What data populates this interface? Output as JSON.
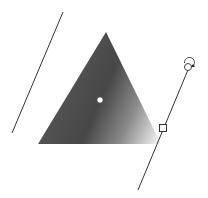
{
  "canvas": {
    "width": 208,
    "height": 198,
    "background": "#ffffff"
  },
  "shape": {
    "type": "triangle",
    "points": "106,32 38,144 161,144",
    "gradient": {
      "type": "linear",
      "stops": [
        {
          "offset": "0%",
          "color": "#5a5a5a"
        },
        {
          "offset": "55%",
          "color": "#4a4a4a"
        },
        {
          "offset": "100%",
          "color": "#f2f2f2"
        }
      ]
    }
  },
  "gradient_tool": {
    "start_line": {
      "x1": 63,
      "y1": 12,
      "x2": 12,
      "y2": 133
    },
    "end_line": {
      "x1": 190,
      "y1": 65,
      "x2": 138,
      "y2": 190
    },
    "center_handle": {
      "cx": 100,
      "cy": 100
    },
    "end_handle": {
      "x": 160,
      "y": 125
    },
    "rotate_handle": {
      "cx": 188,
      "cy": 67
    }
  }
}
